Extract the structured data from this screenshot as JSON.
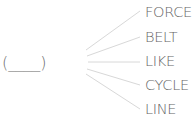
{
  "puzzle": {
    "blank": "(____)",
    "blank_letters": 4,
    "words": [
      {
        "label": "FORCE"
      },
      {
        "label": "BELT"
      },
      {
        "label": "LIKE"
      },
      {
        "label": "CYCLE"
      },
      {
        "label": "LINE"
      }
    ]
  },
  "colors": {
    "text": "#666666",
    "connector": "#d6d6d6"
  }
}
